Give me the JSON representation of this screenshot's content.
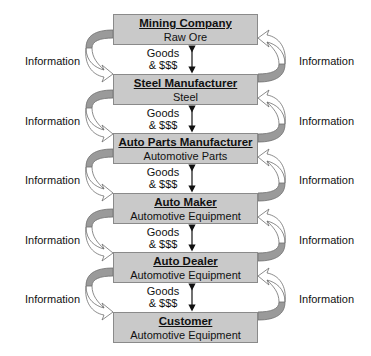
{
  "diagram": {
    "type": "supply-chain",
    "nodes": [
      {
        "name": "Mining Company",
        "product": "Raw Ore"
      },
      {
        "name": "Steel Manufacturer",
        "product": "Steel"
      },
      {
        "name": "Auto Parts Manufacturer",
        "product": "Automotive Parts"
      },
      {
        "name": "Auto Maker",
        "product": "Automotive Equipment"
      },
      {
        "name": "Auto Dealer",
        "product": "Automotive Equipment"
      },
      {
        "name": "Customer",
        "product": "Automotive Equipment"
      }
    ],
    "flows": [
      {
        "goods_line1": "Goods",
        "goods_line2": "& $$$",
        "info_left": "Information",
        "info_right": "Information"
      },
      {
        "goods_line1": "Goods",
        "goods_line2": "& $$$",
        "info_left": "Information",
        "info_right": "Information"
      },
      {
        "goods_line1": "Goods",
        "goods_line2": "& $$$",
        "info_left": "Information",
        "info_right": "Information"
      },
      {
        "goods_line1": "Goods",
        "goods_line2": "& $$$",
        "info_left": "Information",
        "info_right": "Information"
      },
      {
        "goods_line1": "Goods",
        "goods_line2": "& $$$",
        "info_left": "Information",
        "info_right": "Information"
      }
    ],
    "colors": {
      "box_fill": "#c9c9c9",
      "box_border": "#8a8a8a",
      "arrow_band": "#9a9a9a",
      "arrow_outline": "#6e6e6e",
      "arrow_head_fill": "#ffffff"
    }
  }
}
